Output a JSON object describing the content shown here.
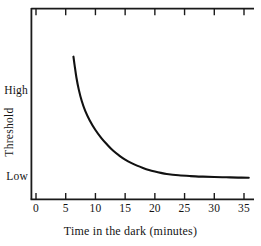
{
  "chart_data": {
    "type": "line",
    "title": "",
    "xlabel": "Time in the dark (minutes)",
    "ylabel": "Threshold",
    "xlim": [
      0,
      35.8
    ],
    "ylim": [
      0,
      1
    ],
    "grid": false,
    "legend": "none",
    "x_ticks": [
      "0",
      "5",
      "10",
      "15",
      "20",
      "25",
      "30",
      "35"
    ],
    "x_tick_values": [
      0,
      5,
      10,
      15,
      20,
      25,
      30,
      35
    ],
    "y_ticks": [
      "High",
      "Low"
    ],
    "y_tick_values": [
      0.745,
      0.11
    ],
    "top_axis_ticks": [
      0,
      5,
      10,
      15,
      20,
      25,
      30,
      35
    ],
    "series": [
      {
        "name": "Dark adaptation threshold",
        "x": [
          6.3,
          6.5,
          6.8,
          7.2,
          7.7,
          8.3,
          9.0,
          10.0,
          11.0,
          12.0,
          13.0,
          14.0,
          15.0,
          16.0,
          17.0,
          18.0,
          19.0,
          20.0,
          21.0,
          22.0,
          24.0,
          26.0,
          28.0,
          30.0,
          32.0,
          34.0,
          35.8
        ],
        "y": [
          0.995,
          0.93,
          0.84,
          0.75,
          0.665,
          0.59,
          0.525,
          0.45,
          0.39,
          0.34,
          0.295,
          0.26,
          0.23,
          0.205,
          0.185,
          0.168,
          0.153,
          0.141,
          0.131,
          0.123,
          0.113,
          0.107,
          0.103,
          0.1,
          0.098,
          0.096,
          0.095
        ]
      }
    ],
    "annotations": []
  },
  "axis": {
    "x_label": "Time in the dark (minutes)",
    "y_label": "Threshold",
    "y_high_label": "High",
    "y_low_label": "Low",
    "x_tick_labels": [
      "0",
      "5",
      "10",
      "15",
      "20",
      "25",
      "30",
      "35"
    ]
  },
  "colors": {
    "line": "#111111",
    "axis": "#1a1a1a",
    "background": "#ffffff",
    "text": "#141414"
  }
}
